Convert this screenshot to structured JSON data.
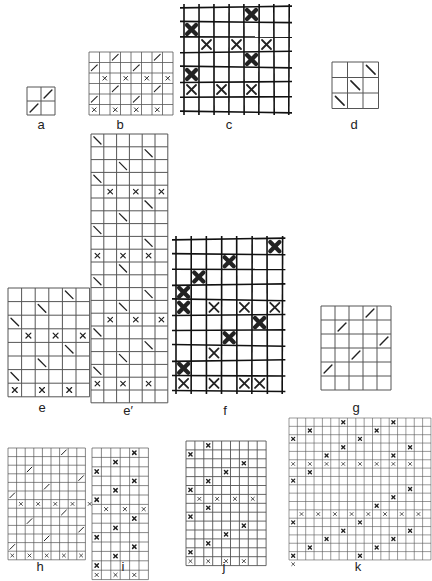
{
  "labels": {
    "a": "a",
    "b": "b",
    "c": "c",
    "d": "d",
    "e": "e",
    "e_prime": "e′",
    "f": "f",
    "g": "g",
    "h": "h",
    "i": "i",
    "j": "j",
    "k": "k"
  },
  "colors": {
    "line": "#555555",
    "mark": "#222222",
    "hand": "#111111"
  },
  "figures": [
    {
      "id": "a",
      "x": 26,
      "y": 86,
      "cell": 14,
      "cols": 2,
      "rows": 2,
      "style": "print",
      "lw": 1,
      "marks": [
        [
          0,
          1,
          "/"
        ],
        [
          1,
          0,
          "/"
        ]
      ],
      "label_x": 26,
      "label_y": 123
    },
    {
      "id": "b",
      "x": 88,
      "y": 51,
      "cell": 10.5,
      "cols": 8,
      "rows": 6,
      "style": "print",
      "lw": 0.8,
      "marks": [
        [
          0,
          2,
          "/"
        ],
        [
          0,
          6,
          "/"
        ],
        [
          1,
          0,
          "/"
        ],
        [
          1,
          4,
          "/"
        ],
        [
          2,
          1,
          "x"
        ],
        [
          2,
          3,
          "x"
        ],
        [
          2,
          5,
          "x"
        ],
        [
          2,
          7,
          "x"
        ],
        [
          3,
          2,
          "/"
        ],
        [
          3,
          6,
          "/"
        ],
        [
          4,
          0,
          "/"
        ],
        [
          4,
          4,
          "/"
        ],
        [
          5,
          0,
          "x"
        ],
        [
          5,
          2,
          "x"
        ],
        [
          5,
          4,
          "x"
        ],
        [
          5,
          6,
          "x"
        ]
      ],
      "label_x": 102,
      "label_y": 121
    },
    {
      "id": "c",
      "x": 183,
      "y": 6,
      "cell": 15,
      "cols": 7,
      "rows": 7,
      "style": "hand",
      "lw": 1.6,
      "marks": [
        [
          0,
          4,
          "X"
        ],
        [
          1,
          0,
          "X"
        ],
        [
          2,
          1,
          "x"
        ],
        [
          2,
          3,
          "x"
        ],
        [
          2,
          5,
          "x"
        ],
        [
          3,
          4,
          "X"
        ],
        [
          4,
          0,
          "X"
        ],
        [
          5,
          0,
          "x"
        ],
        [
          5,
          2,
          "x"
        ],
        [
          5,
          4,
          "x"
        ]
      ],
      "label_x": 210,
      "label_y": 121
    },
    {
      "id": "d",
      "x": 331,
      "y": 61,
      "cell": 15.5,
      "cols": 3,
      "rows": 3,
      "style": "print",
      "lw": 1,
      "marks": [
        [
          0,
          2,
          "\\"
        ],
        [
          1,
          1,
          "\\"
        ],
        [
          2,
          0,
          "\\"
        ]
      ],
      "label_x": 335,
      "label_y": 121
    },
    {
      "id": "e",
      "x": 7,
      "y": 287,
      "cell": 13.6,
      "cols": 6,
      "rows": 8,
      "style": "print",
      "lw": 1,
      "marks": [
        [
          0,
          4,
          "\\"
        ],
        [
          1,
          2,
          "\\"
        ],
        [
          2,
          0,
          "\\"
        ],
        [
          3,
          1,
          "x"
        ],
        [
          3,
          3,
          "x"
        ],
        [
          3,
          5,
          "x"
        ],
        [
          4,
          4,
          "\\"
        ],
        [
          5,
          2,
          "\\"
        ],
        [
          6,
          0,
          "\\"
        ],
        [
          7,
          0,
          "x"
        ],
        [
          7,
          2,
          "x"
        ],
        [
          7,
          4,
          "x"
        ]
      ],
      "label_x": 22,
      "label_y": 403
    },
    {
      "id": "e_prime",
      "x": 90,
      "y": 133,
      "cell": 12.8,
      "cols": 6,
      "rows": 21,
      "style": "print",
      "lw": 1,
      "marks": [
        [
          0,
          0,
          "\\"
        ],
        [
          1,
          4,
          "\\"
        ],
        [
          2,
          2,
          "\\"
        ],
        [
          3,
          0,
          "\\"
        ],
        [
          4,
          1,
          "x"
        ],
        [
          4,
          3,
          "x"
        ],
        [
          4,
          5,
          "x"
        ],
        [
          5,
          4,
          "\\"
        ],
        [
          6,
          2,
          "\\"
        ],
        [
          7,
          0,
          "\\"
        ],
        [
          8,
          4,
          "\\"
        ],
        [
          9,
          0,
          "x"
        ],
        [
          9,
          2,
          "x"
        ],
        [
          9,
          4,
          "x"
        ],
        [
          10,
          2,
          "\\"
        ],
        [
          11,
          0,
          "\\"
        ],
        [
          12,
          4,
          "\\"
        ],
        [
          13,
          2,
          "\\"
        ],
        [
          14,
          1,
          "x"
        ],
        [
          14,
          3,
          "x"
        ],
        [
          14,
          5,
          "x"
        ],
        [
          15,
          0,
          "\\"
        ],
        [
          16,
          4,
          "\\"
        ],
        [
          17,
          2,
          "\\"
        ],
        [
          18,
          0,
          "\\"
        ],
        [
          19,
          0,
          "x"
        ],
        [
          19,
          2,
          "x"
        ],
        [
          19,
          4,
          "x"
        ]
      ],
      "label_x": 109,
      "label_y": 405
    },
    {
      "id": "f",
      "x": 175,
      "y": 238,
      "cell": 15.2,
      "cols": 7,
      "rows": 10,
      "style": "hand",
      "lw": 1.6,
      "marks": [
        [
          0,
          6,
          "X"
        ],
        [
          1,
          3,
          "X"
        ],
        [
          2,
          1,
          "X"
        ],
        [
          3,
          0,
          "X"
        ],
        [
          4,
          0,
          "X"
        ],
        [
          4,
          2,
          "x"
        ],
        [
          4,
          4,
          "x"
        ],
        [
          4,
          6,
          "x"
        ],
        [
          5,
          5,
          "X"
        ],
        [
          6,
          3,
          "X"
        ],
        [
          7,
          2,
          "x"
        ],
        [
          8,
          0,
          "X"
        ],
        [
          9,
          0,
          "x"
        ],
        [
          9,
          2,
          "x"
        ],
        [
          9,
          4,
          "x"
        ],
        [
          9,
          5,
          "x"
        ]
      ],
      "label_x": 206,
      "label_y": 405
    },
    {
      "id": "g",
      "x": 320,
      "y": 305,
      "cell": 14,
      "cols": 5,
      "rows": 6,
      "style": "print",
      "lw": 1,
      "marks": [
        [
          0,
          3,
          "/"
        ],
        [
          1,
          1,
          "/"
        ],
        [
          2,
          4,
          "/"
        ],
        [
          3,
          2,
          "/"
        ],
        [
          4,
          0,
          "/"
        ]
      ],
      "label_x": 337,
      "label_y": 402
    },
    {
      "id": "h",
      "x": 7,
      "y": 447,
      "cell": 8.6,
      "cols": 9,
      "rows": 13,
      "style": "print",
      "lw": 0.7,
      "marks": [
        [
          0,
          6,
          "/"
        ],
        [
          2,
          2,
          "/"
        ],
        [
          3,
          8,
          "/"
        ],
        [
          4,
          4,
          "/"
        ],
        [
          5,
          0,
          "/"
        ],
        [
          6,
          1,
          "x"
        ],
        [
          6,
          3,
          "x"
        ],
        [
          6,
          5,
          "x"
        ],
        [
          6,
          7,
          "x"
        ],
        [
          6,
          9,
          "x"
        ],
        [
          7,
          6,
          "/"
        ],
        [
          8,
          2,
          "/"
        ],
        [
          9,
          8,
          "/"
        ],
        [
          10,
          4,
          "/"
        ],
        [
          11,
          0,
          "/"
        ],
        [
          12,
          0,
          "x"
        ],
        [
          12,
          2,
          "x"
        ],
        [
          12,
          4,
          "x"
        ],
        [
          12,
          6,
          "x"
        ],
        [
          12,
          8,
          "x"
        ]
      ],
      "label_x": 21,
      "label_y": 561
    },
    {
      "id": "i",
      "x": 91,
      "y": 447,
      "cell": 9.4,
      "cols": 6,
      "rows": 14,
      "style": "print",
      "lw": 0.7,
      "marks": [
        [
          0,
          4,
          "X"
        ],
        [
          1,
          2,
          "X"
        ],
        [
          2,
          0,
          "X"
        ],
        [
          3,
          4,
          "X"
        ],
        [
          4,
          2,
          "X"
        ],
        [
          5,
          0,
          "X"
        ],
        [
          6,
          1,
          "x"
        ],
        [
          6,
          3,
          "x"
        ],
        [
          6,
          5,
          "x"
        ],
        [
          7,
          4,
          "X"
        ],
        [
          8,
          2,
          "X"
        ],
        [
          9,
          0,
          "X"
        ],
        [
          10,
          4,
          "X"
        ],
        [
          11,
          2,
          "X"
        ],
        [
          12,
          0,
          "X"
        ],
        [
          13,
          0,
          "x"
        ],
        [
          13,
          2,
          "x"
        ],
        [
          13,
          4,
          "x"
        ]
      ],
      "label_x": 104,
      "label_y": 561
    },
    {
      "id": "j",
      "x": 185,
      "y": 440,
      "cell": 8.9,
      "cols": 9,
      "rows": 14,
      "style": "print",
      "lw": 0.9,
      "marks": [
        [
          0,
          2,
          "X"
        ],
        [
          1,
          0,
          "X"
        ],
        [
          2,
          6,
          "X"
        ],
        [
          3,
          4,
          "X"
        ],
        [
          4,
          2,
          "X"
        ],
        [
          5,
          0,
          "X"
        ],
        [
          6,
          1,
          "x"
        ],
        [
          6,
          3,
          "x"
        ],
        [
          6,
          5,
          "x"
        ],
        [
          6,
          7,
          "x"
        ],
        [
          7,
          2,
          "X"
        ],
        [
          8,
          0,
          "X"
        ],
        [
          9,
          6,
          "X"
        ],
        [
          10,
          4,
          "X"
        ],
        [
          11,
          2,
          "X"
        ],
        [
          12,
          0,
          "X"
        ],
        [
          13,
          0,
          "x"
        ],
        [
          13,
          2,
          "x"
        ],
        [
          13,
          4,
          "x"
        ],
        [
          13,
          6,
          "x"
        ]
      ],
      "label_x": 205,
      "label_y": 561
    },
    {
      "id": "k",
      "x": 288,
      "y": 417,
      "cell": 8.35,
      "cols": 17,
      "rows": 17,
      "style": "print",
      "lw": 0.6,
      "marks": [
        [
          0,
          6,
          "X"
        ],
        [
          0,
          12,
          "X"
        ],
        [
          1,
          2,
          "X"
        ],
        [
          1,
          10,
          "X"
        ],
        [
          2,
          0,
          "X"
        ],
        [
          2,
          8,
          "X"
        ],
        [
          3,
          6,
          "X"
        ],
        [
          3,
          14,
          "X"
        ],
        [
          4,
          4,
          "X"
        ],
        [
          4,
          12,
          "X"
        ],
        [
          5,
          0,
          "x"
        ],
        [
          5,
          2,
          "x"
        ],
        [
          5,
          4,
          "x"
        ],
        [
          5,
          6,
          "x"
        ],
        [
          5,
          8,
          "x"
        ],
        [
          5,
          10,
          "x"
        ],
        [
          5,
          12,
          "x"
        ],
        [
          5,
          14,
          "x"
        ],
        [
          6,
          2,
          "X"
        ],
        [
          7,
          0,
          "X"
        ],
        [
          8,
          14,
          "X"
        ],
        [
          9,
          12,
          "X"
        ],
        [
          10,
          10,
          "X"
        ],
        [
          11,
          1,
          "x"
        ],
        [
          11,
          3,
          "x"
        ],
        [
          11,
          5,
          "x"
        ],
        [
          11,
          7,
          "x"
        ],
        [
          11,
          9,
          "x"
        ],
        [
          11,
          11,
          "x"
        ],
        [
          11,
          13,
          "x"
        ],
        [
          11,
          15,
          "x"
        ],
        [
          12,
          0,
          "X"
        ],
        [
          12,
          8,
          "X"
        ],
        [
          13,
          6,
          "X"
        ],
        [
          13,
          14,
          "X"
        ],
        [
          14,
          4,
          "X"
        ],
        [
          14,
          12,
          "X"
        ],
        [
          15,
          2,
          "X"
        ],
        [
          15,
          10,
          "X"
        ],
        [
          16,
          0,
          "X"
        ],
        [
          16,
          8,
          "X"
        ],
        [
          17,
          0,
          "x"
        ]
      ],
      "label_x": 339,
      "label_y": 561
    }
  ]
}
